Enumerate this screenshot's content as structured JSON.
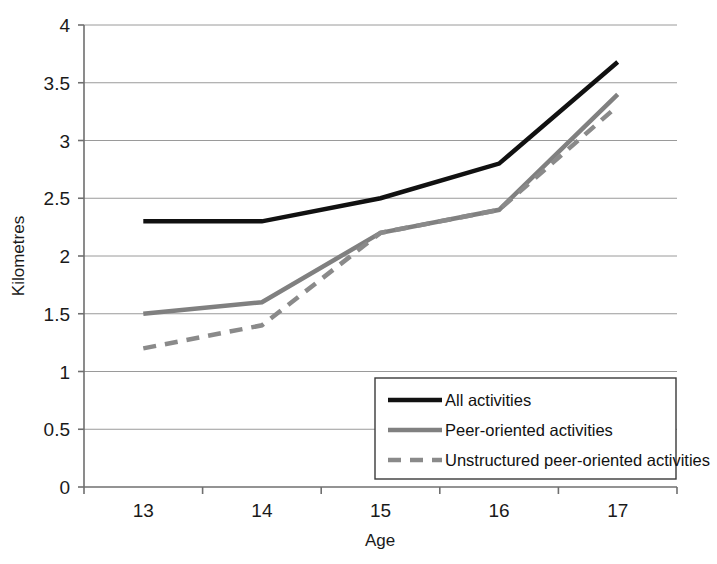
{
  "chart_data": {
    "type": "line",
    "title": "",
    "xlabel": "Age",
    "ylabel": "Kilometres",
    "categories": [
      "13",
      "14",
      "15",
      "16",
      "17"
    ],
    "x_tick_labels": [
      "13",
      "14",
      "15",
      "16",
      "17"
    ],
    "y_tick_labels": [
      "0",
      "0.5",
      "1",
      "1.5",
      "2",
      "2.5",
      "3",
      "3.5",
      "4"
    ],
    "y_tick_values": [
      0,
      0.5,
      1,
      1.5,
      2,
      2.5,
      3,
      3.5,
      4
    ],
    "ylim": [
      0,
      4
    ],
    "grid": "horizontal",
    "legend_position": "inside-bottom-right",
    "series": [
      {
        "name": "All activities",
        "values": [
          2.3,
          2.3,
          2.5,
          2.8,
          3.68
        ],
        "color": "#111111",
        "style": "solid",
        "width": 4.5
      },
      {
        "name": "Peer-oriented activities",
        "values": [
          1.5,
          1.6,
          2.2,
          2.4,
          3.4
        ],
        "color": "#808080",
        "style": "solid",
        "width": 4.5
      },
      {
        "name": "Unstructured peer-oriented activities",
        "values": [
          1.2,
          1.4,
          2.2,
          2.4,
          3.3
        ],
        "color": "#8a8a8a",
        "style": "dashed",
        "width": 4.5
      }
    ]
  },
  "axes": {
    "y_label": "Kilometres",
    "x_label": "Age"
  },
  "legend": {
    "items": [
      {
        "label": "All activities"
      },
      {
        "label": "Peer-oriented activities"
      },
      {
        "label": "Unstructured peer-oriented activities"
      }
    ]
  },
  "colors": {
    "axis": "#6f6f6f",
    "grid": "#9a9a9a",
    "series_primary": "#111111",
    "series_secondary": "#808080",
    "series_tertiary": "#8a8a8a",
    "text": "#1a1a1a",
    "background": "#ffffff"
  }
}
